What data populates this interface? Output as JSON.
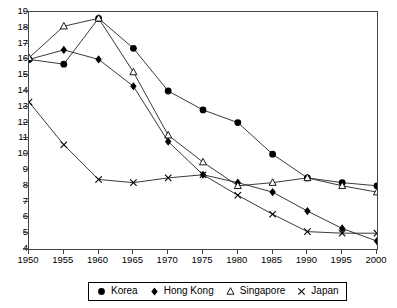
{
  "chart_data": {
    "type": "line",
    "title": "",
    "xlabel": "",
    "ylabel": "",
    "x": [
      1950,
      1955,
      1960,
      1965,
      1970,
      1975,
      1980,
      1985,
      1990,
      1995,
      2000
    ],
    "xtick_labels": [
      "1950",
      "1955",
      "1960",
      "1965",
      "1970",
      "1975",
      "1980",
      "1985",
      "1990",
      "1995",
      "2000"
    ],
    "ytick_labels": [
      "4",
      "5",
      "6",
      "7",
      "8",
      "9",
      "10",
      "11",
      "12",
      "13",
      "14",
      "15",
      "16",
      "17",
      "18",
      "19"
    ],
    "xlim": [
      1950,
      2000
    ],
    "ylim": [
      4,
      19
    ],
    "grid": false,
    "legend_position": "bottom",
    "series": [
      {
        "name": "Korea",
        "marker": "filled-circle",
        "color": "#000000",
        "values": [
          16.0,
          15.7,
          18.6,
          16.7,
          14.0,
          12.8,
          12.0,
          10.0,
          8.5,
          8.2,
          8.0
        ]
      },
      {
        "name": "Hong Kong",
        "marker": "filled-diamond",
        "color": "#000000",
        "values": [
          16.0,
          16.6,
          16.0,
          14.3,
          10.8,
          8.7,
          8.2,
          7.6,
          6.4,
          5.3,
          4.5
        ]
      },
      {
        "name": "Singapore",
        "marker": "open-triangle",
        "color": "#000000",
        "values": [
          16.1,
          18.1,
          18.6,
          15.2,
          11.2,
          9.5,
          8.0,
          8.2,
          8.5,
          8.0,
          7.6
        ]
      },
      {
        "name": "Japan",
        "marker": "cross",
        "color": "#000000",
        "values": [
          13.3,
          10.6,
          8.4,
          8.2,
          8.5,
          8.7,
          7.4,
          6.2,
          5.1,
          5.0,
          5.0
        ]
      }
    ]
  },
  "legend": {
    "items": [
      {
        "label": "Korea",
        "marker": "filled-circle"
      },
      {
        "label": "Hong Kong",
        "marker": "filled-diamond"
      },
      {
        "label": "Singapore",
        "marker": "open-triangle"
      },
      {
        "label": "Japan",
        "marker": "cross"
      }
    ]
  },
  "colors": {
    "line": "#222222",
    "axis": "#444444",
    "background": "#ffffff",
    "marker": "#000000"
  }
}
